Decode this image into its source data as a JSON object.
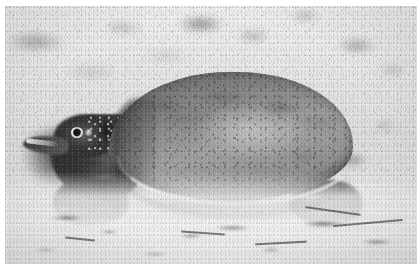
{
  "image": {
    "title": "Softshell turtle on sand",
    "medium": "black-and-white photograph",
    "border_color": "#ffffff",
    "caption": "",
    "subject": {
      "name": "softshell turtle",
      "orientation": "facing left, in profile",
      "features": [
        "broad flat leathery carapace",
        "elongated tubular snout",
        "small round eye with pale ring",
        "clawed front foot",
        "clawed hind foot",
        "wrinkled neck skin"
      ]
    },
    "scene": {
      "ground": "dry light sand",
      "background": "out-of-focus sand with dark pebbles and debris",
      "lighting": "bright overhead daylight",
      "shadow": "dark shadow beneath shell and head"
    },
    "palette": {
      "sand_light": "#e9e9e6",
      "sand_mid": "#d9d9d6",
      "shell_light": "#a0a09a",
      "shell_mid": "#8e8e88",
      "shell_dark": "#6e6e69",
      "shadow_dark": "#1a1a18",
      "rim_highlight": "#e8e8e4"
    }
  }
}
